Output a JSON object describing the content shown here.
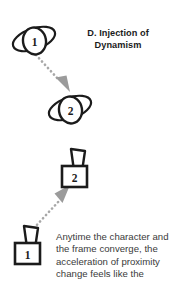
{
  "figure": {
    "title_line_1": "D. Injection of",
    "title_line_2": "Dynamism",
    "caption_lines": [
      "Anytime the character and",
      "the frame converge, the",
      "acceleration of proximity",
      "change feels like the"
    ],
    "colors": {
      "background": "#ffffff",
      "ink": "#1b1b1b",
      "caption_text": "#3a3a3a",
      "arrow_gray": "#a8a8a8",
      "arrow_head_gray": "#9b9b9b"
    },
    "panels": [
      {
        "id": "panel-top",
        "shape_style": "tilted-ellipse-with-inner-oval",
        "markers": [
          {
            "label": "1",
            "position": "upper-left"
          },
          {
            "label": "2",
            "position": "lower-center"
          }
        ],
        "arrow": {
          "style": "dotted",
          "direction": "down-right",
          "from_marker": "1",
          "to_marker": "2"
        }
      },
      {
        "id": "panel-bottom",
        "shape_style": "rectangle-with-trapezoid-top",
        "markers": [
          {
            "label": "1",
            "position": "lower-left"
          },
          {
            "label": "2",
            "position": "upper-center"
          }
        ],
        "arrow": {
          "style": "dotted",
          "direction": "up-right",
          "from_marker": "1",
          "to_marker": "2"
        }
      }
    ]
  }
}
